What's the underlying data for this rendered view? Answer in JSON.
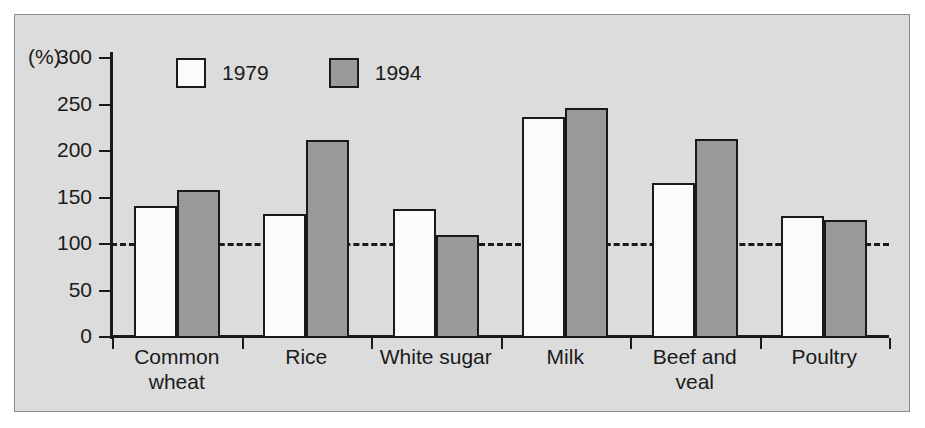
{
  "chart_data": {
    "type": "bar",
    "title": "",
    "xlabel": "",
    "ylabel": "(%)",
    "ylim": [
      0,
      300
    ],
    "yticks": [
      0,
      50,
      100,
      150,
      200,
      250,
      300
    ],
    "grid": false,
    "legend_position": "top-left-inside",
    "reference_line": {
      "value": 100,
      "style": "dashed",
      "label": ""
    },
    "categories": [
      "Common wheat",
      "Rice",
      "White sugar",
      "Milk",
      "Beef and veal",
      "Poultry"
    ],
    "category_lines": [
      [
        "Common",
        "wheat"
      ],
      [
        "Rice",
        ""
      ],
      [
        "White sugar",
        ""
      ],
      [
        "Milk",
        ""
      ],
      [
        "Beef and",
        "veal"
      ],
      [
        "Poultry",
        ""
      ]
    ],
    "series": [
      {
        "name": "1979",
        "color": "#fbfbfb",
        "values": [
          141,
          132,
          138,
          237,
          166,
          130
        ]
      },
      {
        "name": "1994",
        "color": "#9a9a9a",
        "values": [
          158,
          212,
          110,
          246,
          213,
          126
        ]
      }
    ]
  },
  "axis": {
    "unit_label": "(%)",
    "tick_labels": [
      "300",
      "250",
      "200",
      "150",
      "100",
      "50",
      "0"
    ]
  },
  "legend": {
    "items": [
      {
        "label": "1979",
        "swatch": "white-swatch"
      },
      {
        "label": "1994",
        "swatch": "gray-swatch"
      }
    ]
  },
  "colors": {
    "background": "#dcdcdc",
    "ink": "#1a1a1a",
    "series_1979": "#fbfbfb",
    "series_1994": "#9a9a9a"
  }
}
